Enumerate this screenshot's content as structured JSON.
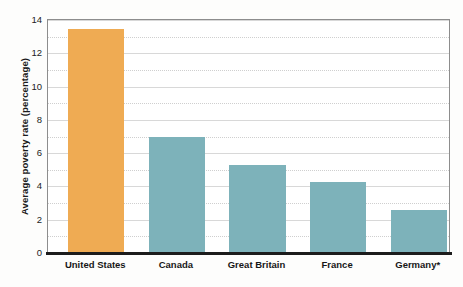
{
  "chart_data": {
    "type": "bar",
    "title": "",
    "subtitle": "",
    "xlabel": "",
    "ylabel": "Average poverty rate (percentage)",
    "categories": [
      "United States",
      "Canada",
      "Great Britain",
      "France",
      "Germany*"
    ],
    "values": [
      13.4,
      6.9,
      5.2,
      4.2,
      2.5
    ],
    "bar_colors": [
      "#efab53",
      "#7db2ba",
      "#7db2ba",
      "#7db2ba",
      "#7db2ba"
    ],
    "ylim": [
      0,
      14
    ],
    "ytick_labels": [
      "0",
      "2",
      "4",
      "6",
      "8",
      "10",
      "12",
      "14"
    ],
    "ytick_values": [
      0,
      2,
      4,
      6,
      8,
      10,
      12,
      14
    ],
    "minor_gridline_values": [
      1,
      3,
      5,
      7,
      9,
      11,
      13
    ],
    "grid": "horizontal major solid and minor dotted",
    "legend": "none",
    "footnote_marker": "*",
    "accent_color": "#efab53",
    "series_color": "#7db2ba",
    "axis_color": "#8d8d8d",
    "baseline_color": "#1c1c1c"
  }
}
